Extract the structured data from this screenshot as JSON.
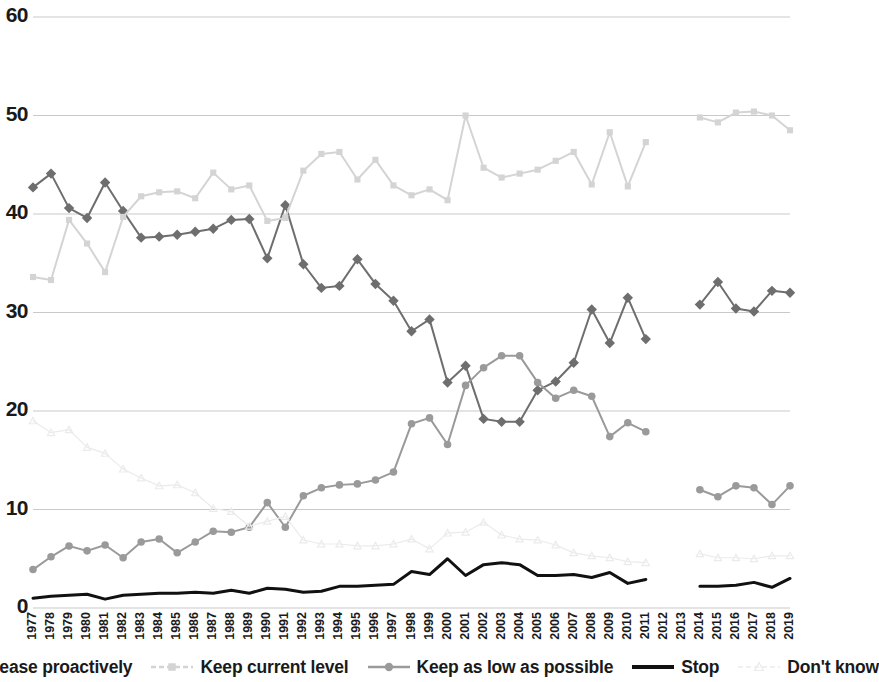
{
  "chart_data": {
    "type": "line",
    "title": "",
    "xlabel": "",
    "ylabel": "",
    "ylim": [
      0,
      60
    ],
    "yticks": [
      0,
      10,
      20,
      30,
      40,
      50,
      60
    ],
    "grid": true,
    "legend_position": "bottom",
    "x": [
      1977,
      1978,
      1979,
      1980,
      1981,
      1982,
      1983,
      1984,
      1985,
      1986,
      1987,
      1988,
      1989,
      1990,
      1991,
      1992,
      1993,
      1994,
      1995,
      1996,
      1997,
      1998,
      1999,
      2000,
      2001,
      2002,
      2003,
      2004,
      2005,
      2006,
      2007,
      2008,
      2009,
      2010,
      2011,
      2012,
      2013,
      2014,
      2015,
      2016,
      2017,
      2018,
      2019
    ],
    "series": [
      {
        "name": "Increase proactively",
        "color": "#6e6e6e",
        "marker": "diamond",
        "values": [
          42.7,
          44.1,
          40.6,
          39.6,
          43.2,
          40.3,
          37.6,
          37.7,
          37.9,
          38.2,
          38.5,
          39.4,
          39.5,
          35.5,
          40.9,
          34.9,
          32.5,
          32.7,
          35.4,
          32.9,
          31.2,
          28.1,
          29.3,
          22.9,
          24.6,
          19.2,
          18.9,
          18.9,
          22.1,
          23.0,
          24.9,
          30.3,
          26.9,
          31.5,
          27.3,
          null,
          null,
          30.8,
          33.1,
          30.4,
          30.1,
          32.2,
          32.0
        ]
      },
      {
        "name": "Keep current level",
        "color": "#d4d4d4",
        "marker": "square",
        "values": [
          33.6,
          33.3,
          39.4,
          37.0,
          34.1,
          39.7,
          41.8,
          42.2,
          42.3,
          41.6,
          44.2,
          42.5,
          42.9,
          39.3,
          39.6,
          44.4,
          46.1,
          46.3,
          43.5,
          45.5,
          42.9,
          41.9,
          42.5,
          41.4,
          50.0,
          44.7,
          43.7,
          44.1,
          44.5,
          45.4,
          46.3,
          43.0,
          48.3,
          42.8,
          47.3,
          null,
          null,
          49.8,
          49.3,
          50.3,
          50.4,
          50.0,
          48.5
        ]
      },
      {
        "name": "Keep as low as possible",
        "color": "#9a9a9a",
        "marker": "circle",
        "values": [
          3.9,
          5.2,
          6.3,
          5.8,
          6.4,
          5.1,
          6.7,
          7.0,
          5.6,
          6.7,
          7.8,
          7.7,
          8.2,
          10.7,
          8.2,
          11.4,
          12.2,
          12.5,
          12.6,
          13.0,
          13.8,
          18.7,
          19.3,
          16.6,
          22.6,
          24.4,
          25.6,
          25.6,
          22.9,
          21.3,
          22.1,
          21.5,
          17.4,
          18.8,
          17.9,
          null,
          null,
          12.0,
          11.3,
          12.4,
          12.2,
          10.5,
          12.4
        ]
      },
      {
        "name": "Stop",
        "color": "#111111",
        "marker": "none",
        "values": [
          1.0,
          1.2,
          1.3,
          1.4,
          0.9,
          1.3,
          1.4,
          1.5,
          1.5,
          1.6,
          1.5,
          1.8,
          1.5,
          2.0,
          1.9,
          1.6,
          1.7,
          2.2,
          2.2,
          2.3,
          2.4,
          3.7,
          3.4,
          5.0,
          3.3,
          4.4,
          4.6,
          4.4,
          3.3,
          3.3,
          3.4,
          3.1,
          3.6,
          2.5,
          2.9,
          null,
          null,
          2.2,
          2.2,
          2.3,
          2.6,
          2.1,
          3.0
        ]
      },
      {
        "name": "Don't know",
        "color": "#ebebeb",
        "marker": "triangle",
        "values": [
          19.0,
          17.8,
          18.1,
          16.3,
          15.7,
          14.1,
          13.2,
          12.4,
          12.5,
          11.7,
          10.1,
          9.8,
          8.3,
          8.8,
          9.3,
          6.9,
          6.5,
          6.5,
          6.3,
          6.3,
          6.5,
          7.0,
          6.0,
          7.6,
          7.7,
          8.7,
          7.4,
          7.0,
          6.9,
          6.4,
          5.6,
          5.3,
          5.1,
          4.7,
          4.6,
          null,
          null,
          5.5,
          5.1,
          5.1,
          5.0,
          5.3,
          5.3
        ]
      }
    ]
  },
  "axes": {
    "y_labels": [
      "60",
      "50",
      "40",
      "30",
      "20",
      "10",
      "0"
    ],
    "x_labels": [
      "1977",
      "1978",
      "1979",
      "1980",
      "1981",
      "1982",
      "1983",
      "1984",
      "1985",
      "1986",
      "1987",
      "1988",
      "1989",
      "1990",
      "1991",
      "1992",
      "1993",
      "1994",
      "1995",
      "1996",
      "1997",
      "1998",
      "1999",
      "2000",
      "2001",
      "2002",
      "2003",
      "2004",
      "2005",
      "2006",
      "2007",
      "2008",
      "2009",
      "2010",
      "2011",
      "2012",
      "2013",
      "2014",
      "2015",
      "2016",
      "2017",
      "2018",
      "2019"
    ]
  },
  "legend": {
    "items": [
      {
        "label": "Increase proactively",
        "color": "#6e6e6e",
        "marker": "diamond"
      },
      {
        "label": "Keep current level",
        "color": "#d4d4d4",
        "marker": "square"
      },
      {
        "label": "Keep as low as possible",
        "color": "#9a9a9a",
        "marker": "circle"
      },
      {
        "label": "Stop",
        "color": "#111111",
        "marker": "none"
      },
      {
        "label": "Don't know",
        "color": "#ebebeb",
        "marker": "triangle"
      }
    ]
  }
}
